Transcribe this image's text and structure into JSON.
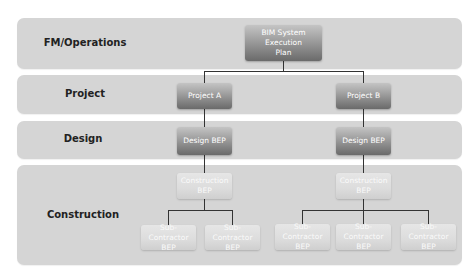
{
  "bands": [
    {
      "label": "FM/Operations"
    },
    {
      "label": "Project"
    },
    {
      "label": "Design"
    },
    {
      "label": "Construction"
    }
  ],
  "nodes": {
    "bim": "BIM System Execution Plan",
    "project_a": "Project A",
    "project_b": "Project B",
    "design_a": "Design BEP",
    "design_b": "Design BEP",
    "construction_a": "Construction BEP",
    "construction_b": "Construction BEP",
    "sub_a1": "Sub-Contractor BEP",
    "sub_a2": "Sub-Contractor BEP",
    "sub_b1": "Sub-Contractor BEP",
    "sub_b2": "Sub-Contractor BEP",
    "sub_b3": "Sub-Contractor BEP"
  },
  "colors": {
    "band": "#d5d5d5",
    "dark_node_top": "#c4c4c4",
    "dark_node_bottom": "#6a6a6a",
    "light_node": "#dcdcdc",
    "connector": "#333333"
  }
}
